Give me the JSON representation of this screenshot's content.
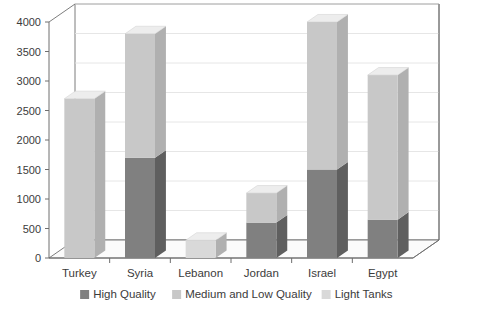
{
  "chart_data": {
    "type": "bar",
    "title": "",
    "subtitle": "",
    "xlabel": "",
    "ylabel": "",
    "stacked": true,
    "three_d": true,
    "grid": true,
    "legend_position": "bottom",
    "ylim": [
      0,
      4000
    ],
    "yticks": [
      0,
      500,
      1000,
      1500,
      2000,
      2500,
      3000,
      3500,
      4000
    ],
    "ytick_labels": [
      "0",
      "500",
      "1000",
      "1500",
      "2000",
      "2500",
      "3000",
      "3500",
      "4000"
    ],
    "categories": [
      "Turkey",
      "Syria",
      "Lebanon",
      "Jordan",
      "Israel",
      "Egypt"
    ],
    "series": [
      {
        "name": "High Quality",
        "color": "#808080",
        "values": [
          0,
          1700,
          0,
          600,
          1500,
          650
        ]
      },
      {
        "name": "Medium and Low Quality",
        "color": "#c8c8c8",
        "values": [
          2700,
          2100,
          0,
          500,
          2500,
          2450
        ]
      },
      {
        "name": "Light Tanks",
        "color": "#d9d9d9",
        "values": [
          0,
          0,
          300,
          0,
          0,
          0
        ]
      }
    ],
    "totals": [
      2700,
      3800,
      300,
      1100,
      4000,
      3100
    ]
  },
  "legend": {
    "items": [
      {
        "label": "High Quality",
        "swatch": "#808080"
      },
      {
        "label": "Medium and Low Quality",
        "swatch": "#c8c8c8"
      },
      {
        "label": "Light Tanks",
        "swatch": "#d9d9d9"
      }
    ]
  },
  "colors": {
    "background": "#ffffff",
    "axis_line": "#6e6e6e",
    "grid_line": "#e3e3e3",
    "floor": "#fbfbfb",
    "bar_side": "#5f5f5f",
    "bar_side_light": "#b0b0b0",
    "bar_top": "#ededed",
    "text": "#3b3b3b"
  },
  "icons": {
    "legend_swatch": "square-swatch-icon"
  }
}
